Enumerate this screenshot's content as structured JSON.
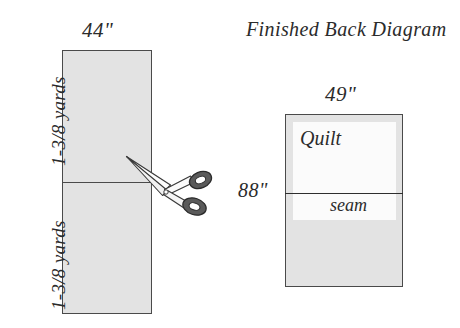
{
  "diagram": {
    "fabric": {
      "width_label": "44\"",
      "yards_label_top": "1-3/8 yards",
      "yards_label_bottom": "1-3/8 yards",
      "fill_color": "#e3e3e3",
      "outline_color": "#4a4a4a",
      "cut_line_name": "cut-line",
      "scissors_icon": "scissors-icon"
    },
    "back": {
      "title": "Finished Back Diagram",
      "width_label": "49\"",
      "height_label": "88\"",
      "quilt_label": "Quilt",
      "seam_label": "seam",
      "fill_color": "#e3e3e3",
      "quilt_fill_color": "#fbfbfb",
      "outline_color": "#4a4a4a",
      "seam_color": "#2e2e2e"
    }
  }
}
